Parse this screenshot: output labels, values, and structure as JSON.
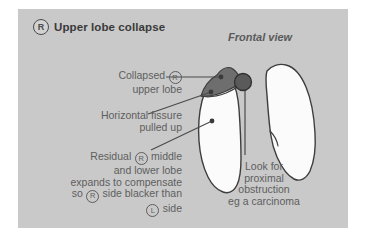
{
  "figure": {
    "title_badge": "R",
    "title": "Upper lobe collapse",
    "view_label": "Frontal view"
  },
  "annotations": {
    "collapsed": {
      "line1_a": "Collapsed ",
      "line1_badge": "R",
      "line2": "upper lobe"
    },
    "fissure": {
      "line1": "Horizontal fissure",
      "line2": "pulled up"
    },
    "residual": {
      "line1_a": "Residual ",
      "line1_badge": "R",
      "line1_b": " middle",
      "line2": "and lower lobe",
      "line3": "expands to compensate",
      "line4_a": "so ",
      "line4_badge": "R",
      "line4_b": " side blacker than",
      "line5_badge": "L",
      "line5_b": " side"
    },
    "look_for": {
      "line1": "Look for",
      "line2": "proximal",
      "line3": "obstruction",
      "line4": "eg a carcinoma"
    }
  },
  "colors": {
    "page_background": "#ffffff",
    "panel_background": "#c9c9c9",
    "lung_fill": "#fbfbfb",
    "lung_outline": "#3d3d3d",
    "collapsed_lobe_fill": "#6e6e6e",
    "hilar_mass_fill": "#5a5a5a",
    "leader_line": "#4a4a4a",
    "title_text": "#3a3a3a",
    "annotation_text": "#5e5e5e"
  }
}
